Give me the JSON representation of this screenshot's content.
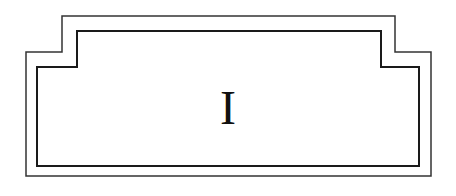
{
  "diagram": {
    "type": "stepped-double-frame",
    "label": "I",
    "colors": {
      "background": "#ffffff",
      "outer_stroke": "#333333",
      "inner_stroke": "#1a1a1a",
      "text": "#111111"
    }
  }
}
